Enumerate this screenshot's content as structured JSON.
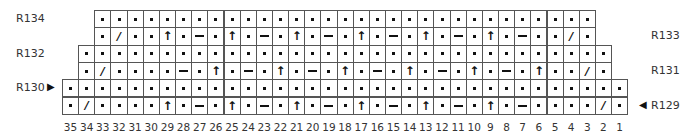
{
  "legend": {
    "purl": "purl-dot",
    "slash": "/",
    "arrow": "↑",
    "dash": "—"
  },
  "rows": [
    {
      "label": "R134",
      "side": "left",
      "marker": "",
      "start_col": 33,
      "end_col": 3,
      "stitches": [
        "p",
        "p",
        "p",
        "p",
        "p",
        "p",
        "p",
        "p",
        "p",
        "p",
        "p",
        "p",
        "p",
        "p",
        "p",
        "p",
        "p",
        "p",
        "p",
        "p",
        "p",
        "p",
        "p",
        "p",
        "p",
        "p",
        "p",
        "p",
        "p",
        "p",
        "p"
      ]
    },
    {
      "label": "R133",
      "side": "right",
      "marker": "",
      "start_col": 33,
      "end_col": 3,
      "stitches": [
        "p",
        "/",
        "p",
        "p",
        "^",
        "p",
        "-",
        "p",
        "^",
        "p",
        "-",
        "p",
        "^",
        "p",
        "-",
        "p",
        "^",
        "p",
        "-",
        "p",
        "^",
        "p",
        "-",
        "p",
        "^",
        "p",
        "-",
        "p",
        "p",
        "/",
        "p"
      ]
    },
    {
      "label": "R132",
      "side": "left",
      "marker": "",
      "start_col": 34,
      "end_col": 2,
      "stitches": [
        "p",
        "p",
        "p",
        "p",
        "p",
        "p",
        "p",
        "p",
        "p",
        "p",
        "p",
        "p",
        "p",
        "p",
        "p",
        "p",
        "p",
        "p",
        "p",
        "p",
        "p",
        "p",
        "p",
        "p",
        "p",
        "p",
        "p",
        "p",
        "p",
        "p",
        "p",
        "p",
        "p"
      ]
    },
    {
      "label": "R131",
      "side": "right",
      "marker": "",
      "start_col": 34,
      "end_col": 2,
      "stitches": [
        "p",
        "/",
        "p",
        "p",
        "p",
        "p",
        "-",
        "p",
        "^",
        "p",
        "-",
        "p",
        "^",
        "p",
        "-",
        "p",
        "^",
        "p",
        "-",
        "p",
        "^",
        "p",
        "-",
        "p",
        "^",
        "p",
        "-",
        "p",
        "^",
        "p",
        "p",
        "/",
        "p"
      ]
    },
    {
      "label": "R130",
      "side": "left",
      "marker": "▶",
      "start_col": 35,
      "end_col": 1,
      "stitches": [
        "p",
        "p",
        "p",
        "p",
        "p",
        "p",
        "p",
        "p",
        "p",
        "p",
        "p",
        "p",
        "p",
        "p",
        "p",
        "p",
        "p",
        "p",
        "p",
        "p",
        "p",
        "p",
        "p",
        "p",
        "p",
        "p",
        "p",
        "p",
        "p",
        "p",
        "p",
        "p",
        "p",
        "p",
        "p"
      ]
    },
    {
      "label": "R129",
      "side": "right",
      "marker": "◀",
      "start_col": 35,
      "end_col": 1,
      "stitches": [
        "p",
        "/",
        "p",
        "p",
        "p",
        "p",
        "^",
        "p",
        "-",
        "p",
        "^",
        "p",
        "-",
        "p",
        "^",
        "p",
        "-",
        "p",
        "^",
        "p",
        "-",
        "p",
        "^",
        "p",
        "-",
        "p",
        "^",
        "p",
        "-",
        "p",
        "p",
        "p",
        "p",
        "/",
        "p"
      ]
    }
  ],
  "column_numbers": [
    "35",
    "34",
    "33",
    "32",
    "31",
    "30",
    "29",
    "28",
    "27",
    "26",
    "25",
    "24",
    "23",
    "22",
    "21",
    "20",
    "19",
    "18",
    "17",
    "16",
    "15",
    "14",
    "13",
    "12",
    "11",
    "10",
    "9",
    "8",
    "7",
    "6",
    "5",
    "4",
    "3",
    "2",
    "1"
  ]
}
